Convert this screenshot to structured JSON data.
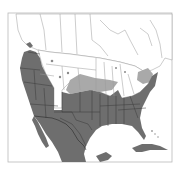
{
  "map": {
    "type": "species-range-map",
    "region": "North America (southern Canada, United States, Mexico, Caribbean)",
    "legend": [],
    "colors": {
      "background": "#ffffff",
      "land": "#ffffff",
      "primary_range": "#6e6e6e",
      "secondary_range": "#a9a9a9",
      "borders": "#3a3a3a",
      "light_borders": "#9a9a9a",
      "frame": "#b0b0b0"
    },
    "frame": {
      "x": 8,
      "y": 13,
      "width": 164,
      "height": 149
    },
    "ranges": [
      {
        "name": "primary-range",
        "description": "dark gray: western US coast, southwest, Mexico, south-central and southeastern US, Cuba"
      },
      {
        "name": "secondary-range",
        "description": "light gray: central plains band (Nebraska/Kansas/Iowa area) and mid-Atlantic patches"
      }
    ]
  }
}
